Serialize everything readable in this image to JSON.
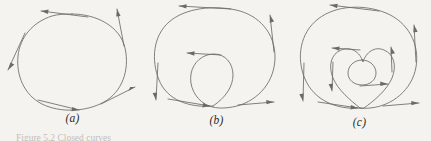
{
  "figure": {
    "background_color": "#f5f3ef",
    "ink_color": "#6d6a66",
    "label_color": "#2b2926",
    "caption_text": "Figure 5.2 Closed curves",
    "caption_prefix": "Figure 5.2",
    "panels": [
      {
        "id": "a",
        "label": "(a)",
        "description": "simple closed convex oval with four tangent direction arrows",
        "loops": 1,
        "winding_number": 1,
        "arrow_count": 4
      },
      {
        "id": "b",
        "label": "(b)",
        "description": "closed curve with one inner loop, doubly wound",
        "loops": 2,
        "winding_number": 2,
        "arrow_count": 5
      },
      {
        "id": "c",
        "label": "(c)",
        "description": "closed curve with two nested inner loops, triply wound",
        "loops": 3,
        "winding_number": 3,
        "arrow_count": 8
      }
    ]
  }
}
